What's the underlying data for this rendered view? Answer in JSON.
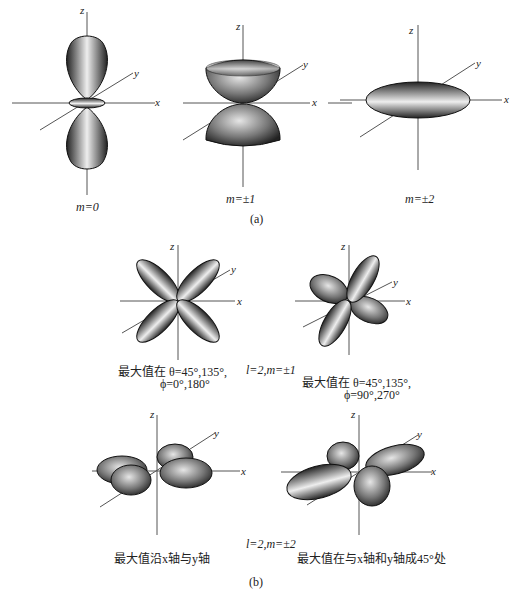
{
  "figure": {
    "part_a": {
      "label": "(a)",
      "panels": [
        {
          "id": "m0",
          "caption": "m=0",
          "axes": {
            "x": "x",
            "y": "y",
            "z": "z"
          }
        },
        {
          "id": "m1",
          "caption": "m=±1",
          "axes": {
            "x": "x",
            "y": "y",
            "z": "z"
          }
        },
        {
          "id": "m2",
          "caption": "m=±2",
          "axes": {
            "x": "x",
            "y": "y",
            "z": "z"
          }
        }
      ]
    },
    "part_b": {
      "label": "(b)",
      "row1": {
        "group_label": "l=2,m=±1",
        "panels": [
          {
            "id": "b1a",
            "axes": {
              "x": "x",
              "y": "y",
              "z": "z"
            },
            "caption_line1": "最大值在 θ=45°,135°,",
            "caption_line2": "ϕ=0°,180°"
          },
          {
            "id": "b1b",
            "axes": {
              "x": "x",
              "y": "y",
              "z": "z"
            },
            "caption_line1": "最大值在 θ=45°,135°,",
            "caption_line2": "ϕ=90°,270°"
          }
        ]
      },
      "row2": {
        "group_label": "l=2,m=±2",
        "panels": [
          {
            "id": "b2a",
            "axes": {
              "x": "x",
              "y": "y",
              "z": "z"
            },
            "caption_line1": "最大值沿x轴与y轴"
          },
          {
            "id": "b2b",
            "axes": {
              "x": "x",
              "y": "y",
              "z": "z"
            },
            "caption_line1": "最大值在与x轴和y轴成45°处"
          }
        ]
      }
    }
  }
}
